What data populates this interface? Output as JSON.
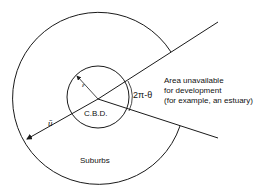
{
  "diagram": {
    "labels": {
      "cbd": "C.B.D.",
      "suburbs": "Suburbs",
      "epsilon": "ε",
      "u_bar": "ū",
      "angle": "2π-θ",
      "area_line1": "Area unavailable",
      "area_line2": "for development",
      "area_line3": "(for example, an estuary)"
    },
    "colors": {
      "stroke": "#1a1a1a",
      "background": "#ffffff"
    }
  }
}
